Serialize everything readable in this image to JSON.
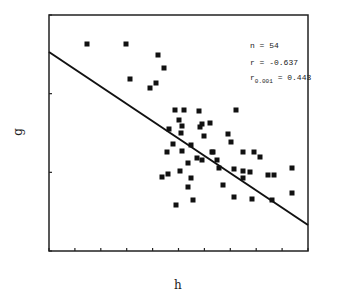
{
  "chart_data": {
    "type": "scatter",
    "title": "",
    "xlabel": "h",
    "ylabel": "g",
    "grid": false,
    "legend": "none",
    "x_ticks": 10,
    "y_ticks": 3,
    "annotations": {
      "n": "n = 54",
      "r": "r = -0.637",
      "r_crit_prefix": "r",
      "r_crit_sub": "0.001",
      "r_crit_suffix": " = 0.443"
    },
    "regression_line": {
      "x1": 49,
      "y1": 52,
      "x2": 308,
      "y2": 225
    },
    "points_px": [
      [
        87,
        44
      ],
      [
        126,
        44
      ],
      [
        158,
        55
      ],
      [
        164,
        68
      ],
      [
        130,
        79
      ],
      [
        156,
        83
      ],
      [
        150,
        88
      ],
      [
        175,
        110
      ],
      [
        184,
        110
      ],
      [
        199,
        111
      ],
      [
        236,
        110
      ],
      [
        179,
        120
      ],
      [
        182,
        126
      ],
      [
        202,
        124
      ],
      [
        210,
        123
      ],
      [
        169,
        129
      ],
      [
        181,
        133
      ],
      [
        200,
        127
      ],
      [
        204,
        136
      ],
      [
        228,
        134
      ],
      [
        231,
        142
      ],
      [
        173,
        144
      ],
      [
        167,
        152
      ],
      [
        182,
        151
      ],
      [
        191,
        145
      ],
      [
        197,
        158
      ],
      [
        202,
        160
      ],
      [
        213,
        152
      ],
      [
        217,
        160
      ],
      [
        219,
        168
      ],
      [
        243,
        152
      ],
      [
        254,
        152
      ],
      [
        260,
        157
      ],
      [
        188,
        163
      ],
      [
        162,
        177
      ],
      [
        168,
        174
      ],
      [
        180,
        171
      ],
      [
        191,
        178
      ],
      [
        188,
        187
      ],
      [
        193,
        200
      ],
      [
        176,
        205
      ],
      [
        234,
        169
      ],
      [
        243,
        171
      ],
      [
        250,
        172
      ],
      [
        243,
        178
      ],
      [
        268,
        175
      ],
      [
        274,
        175
      ],
      [
        292,
        168
      ],
      [
        223,
        185
      ],
      [
        234,
        197
      ],
      [
        252,
        199
      ],
      [
        272,
        200
      ],
      [
        292,
        193
      ],
      [
        212,
        152
      ]
    ]
  },
  "axes": {
    "left": 49,
    "right": 308,
    "top": 15,
    "bottom": 251
  }
}
